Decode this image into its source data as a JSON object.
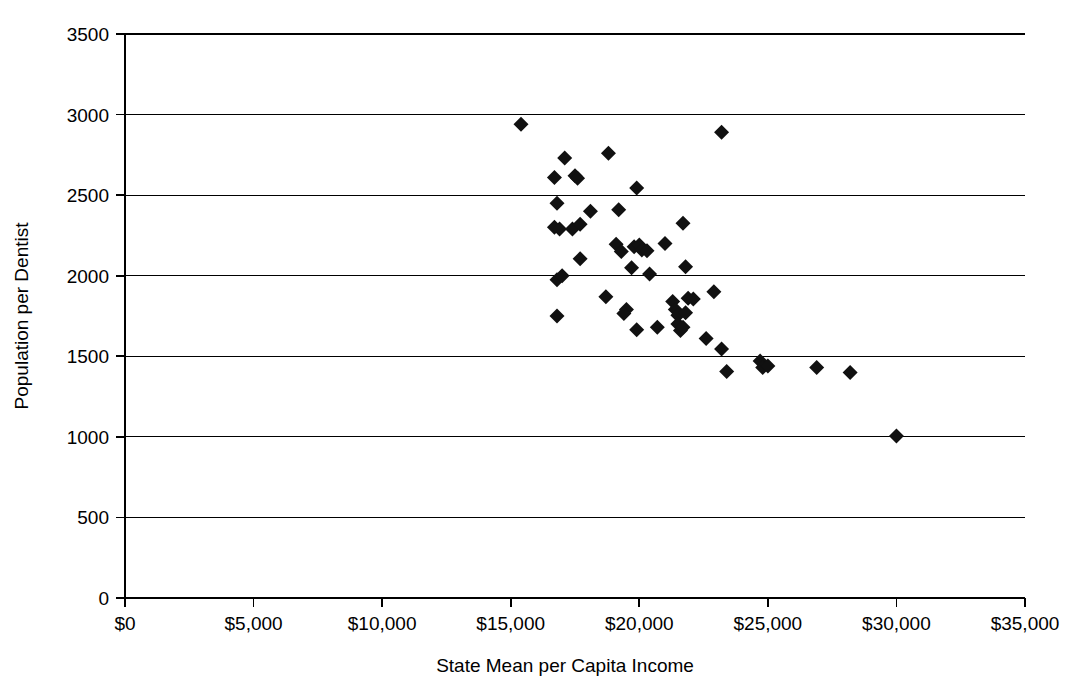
{
  "chart_data": {
    "type": "scatter",
    "title": "",
    "xlabel": "State Mean per Capita Income",
    "ylabel": "Population per Dentist",
    "xlim": [
      0,
      35000
    ],
    "ylim": [
      0,
      3500
    ],
    "xticks": [
      0,
      5000,
      10000,
      15000,
      20000,
      25000,
      30000,
      35000
    ],
    "xtick_labels": [
      "$0",
      "$5,000",
      "$10,000",
      "$15,000",
      "$20,000",
      "$25,000",
      "$30,000",
      "$35,000"
    ],
    "yticks": [
      0,
      500,
      1000,
      1500,
      2000,
      2500,
      3000,
      3500
    ],
    "ytick_labels": [
      "0",
      "500",
      "1000",
      "1500",
      "2000",
      "2500",
      "3000",
      "3500"
    ],
    "grid": "horizontal",
    "legend": "none",
    "marker": "diamond",
    "marker_color": "#111111",
    "marker_size": 12,
    "series": [
      {
        "name": "States",
        "points": [
          [
            15400,
            2940
          ],
          [
            16700,
            2610
          ],
          [
            17100,
            2730
          ],
          [
            17500,
            2620
          ],
          [
            17600,
            2605
          ],
          [
            18800,
            2760
          ],
          [
            23200,
            2890
          ],
          [
            16800,
            2450
          ],
          [
            19900,
            2545
          ],
          [
            16700,
            2300
          ],
          [
            16900,
            2290
          ],
          [
            17400,
            2290
          ],
          [
            17700,
            2320
          ],
          [
            18100,
            2400
          ],
          [
            19200,
            2410
          ],
          [
            21700,
            2325
          ],
          [
            16800,
            1975
          ],
          [
            17000,
            2000
          ],
          [
            17700,
            2105
          ],
          [
            19100,
            2195
          ],
          [
            19300,
            2150
          ],
          [
            19800,
            2180
          ],
          [
            20000,
            2190
          ],
          [
            20100,
            2160
          ],
          [
            20300,
            2155
          ],
          [
            21000,
            2200
          ],
          [
            20400,
            2010
          ],
          [
            19700,
            2050
          ],
          [
            21800,
            2055
          ],
          [
            16800,
            1750
          ],
          [
            18700,
            1870
          ],
          [
            19500,
            1790
          ],
          [
            19400,
            1765
          ],
          [
            19900,
            1665
          ],
          [
            20700,
            1680
          ],
          [
            21300,
            1840
          ],
          [
            21400,
            1790
          ],
          [
            21500,
            1755
          ],
          [
            21500,
            1700
          ],
          [
            21600,
            1660
          ],
          [
            21700,
            1680
          ],
          [
            21800,
            1770
          ],
          [
            21900,
            1860
          ],
          [
            22900,
            1900
          ],
          [
            22100,
            1855
          ],
          [
            22600,
            1610
          ],
          [
            23200,
            1545
          ],
          [
            23400,
            1405
          ],
          [
            24700,
            1470
          ],
          [
            24800,
            1430
          ],
          [
            25000,
            1440
          ],
          [
            26900,
            1430
          ],
          [
            28200,
            1400
          ],
          [
            30000,
            1005
          ]
        ]
      }
    ]
  },
  "axes": {
    "x_title": "State Mean per Capita Income",
    "y_title": "Population per Dentist"
  }
}
